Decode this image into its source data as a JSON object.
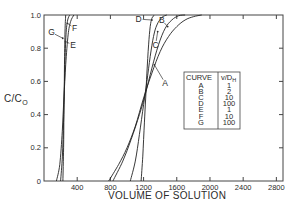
{
  "chart_data": {
    "type": "line",
    "title": "",
    "xlabel": "VOLUME OF SOLUTION",
    "ylabel": "C/C₀",
    "ylabel_main": "C/C",
    "ylabel_sub": "O",
    "xlim": [
      0,
      2880
    ],
    "ylim": [
      0,
      1.0
    ],
    "grid": false,
    "x_ticks": [
      400,
      800,
      1200,
      1600,
      2000,
      2400,
      2800
    ],
    "x_tick_labels": [
      "400",
      "800",
      "1200",
      "1600",
      "2000",
      "2400",
      "2800"
    ],
    "y_ticks": [
      0,
      0.2,
      0.4,
      0.6,
      0.8,
      1.0
    ],
    "y_tick_labels": [
      "0",
      "0.2",
      "0.4",
      "0.6",
      "0.8",
      "1.0"
    ],
    "legend": {
      "position": "inside-lower-right",
      "header": [
        "CURVE",
        "v/Dₕ"
      ],
      "header_curve": "CURVE",
      "header_param_main": "v/D",
      "header_param_sub": "H",
      "rows": [
        {
          "curve": "A",
          "value": "1"
        },
        {
          "curve": "B",
          "value": "2"
        },
        {
          "curve": "C",
          "value": "10"
        },
        {
          "curve": "D",
          "value": "100"
        },
        {
          "curve": "E",
          "value": "1"
        },
        {
          "curve": "F",
          "value": "10"
        },
        {
          "curve": "G",
          "value": "100"
        }
      ]
    },
    "series": [
      {
        "name": "A",
        "vDh": 1,
        "points": [
          [
            780,
            0
          ],
          [
            900,
            0.1
          ],
          [
            1000,
            0.2
          ],
          [
            1100,
            0.33
          ],
          [
            1200,
            0.5
          ],
          [
            1300,
            0.65
          ],
          [
            1400,
            0.78
          ],
          [
            1500,
            0.87
          ],
          [
            1600,
            0.93
          ],
          [
            1700,
            0.97
          ],
          [
            1800,
            0.99
          ],
          [
            1900,
            1.0
          ]
        ]
      },
      {
        "name": "B",
        "vDh": 2,
        "points": [
          [
            830,
            0
          ],
          [
            950,
            0.12
          ],
          [
            1050,
            0.25
          ],
          [
            1150,
            0.4
          ],
          [
            1220,
            0.52
          ],
          [
            1300,
            0.68
          ],
          [
            1380,
            0.82
          ],
          [
            1460,
            0.92
          ],
          [
            1540,
            0.97
          ],
          [
            1620,
            0.995
          ],
          [
            1700,
            1.0
          ]
        ]
      },
      {
        "name": "C",
        "vDh": 10,
        "points": [
          [
            1040,
            0
          ],
          [
            1100,
            0.12
          ],
          [
            1150,
            0.28
          ],
          [
            1200,
            0.46
          ],
          [
            1240,
            0.6
          ],
          [
            1280,
            0.75
          ],
          [
            1320,
            0.87
          ],
          [
            1360,
            0.94
          ],
          [
            1420,
            0.985
          ],
          [
            1480,
            1.0
          ]
        ]
      },
      {
        "name": "D",
        "vDh": 100,
        "points": [
          [
            1170,
            0
          ],
          [
            1190,
            0.15
          ],
          [
            1210,
            0.35
          ],
          [
            1225,
            0.5
          ],
          [
            1240,
            0.65
          ],
          [
            1260,
            0.82
          ],
          [
            1280,
            0.93
          ],
          [
            1300,
            0.98
          ],
          [
            1330,
            1.0
          ]
        ]
      },
      {
        "name": "E",
        "vDh": 1,
        "points": [
          [
            150,
            0
          ],
          [
            190,
            0.1
          ],
          [
            220,
            0.3
          ],
          [
            240,
            0.5
          ],
          [
            262,
            0.7
          ],
          [
            290,
            0.88
          ],
          [
            320,
            0.96
          ],
          [
            360,
            1.0
          ]
        ]
      },
      {
        "name": "F",
        "vDh": 10,
        "points": [
          [
            200,
            0
          ],
          [
            222,
            0.15
          ],
          [
            235,
            0.35
          ],
          [
            243,
            0.5
          ],
          [
            252,
            0.7
          ],
          [
            265,
            0.88
          ],
          [
            285,
            0.97
          ],
          [
            310,
            1.0
          ]
        ]
      },
      {
        "name": "G",
        "vDh": 100,
        "points": [
          [
            228,
            0
          ],
          [
            236,
            0.2
          ],
          [
            240,
            0.4
          ],
          [
            244,
            0.55
          ],
          [
            248,
            0.75
          ],
          [
            254,
            0.92
          ],
          [
            262,
            1.0
          ]
        ]
      }
    ],
    "annotations": [
      {
        "text": "A",
        "at": [
          1330,
          0.7
        ],
        "label_pos": [
          1460,
          0.59
        ]
      },
      {
        "text": "B",
        "at": [
          1490,
          0.93
        ],
        "label_pos": [
          1420,
          0.97
        ]
      },
      {
        "text": "C",
        "at": [
          1370,
          0.9
        ],
        "label_pos": [
          1345,
          0.82
        ]
      },
      {
        "text": "D",
        "at": [
          1300,
          0.97
        ],
        "label_pos": [
          1140,
          0.975
        ]
      },
      {
        "text": "E",
        "at": [
          258,
          0.84
        ],
        "label_pos": [
          350,
          0.82
        ]
      },
      {
        "text": "F",
        "at": [
          282,
          0.95
        ],
        "label_pos": [
          370,
          0.92
        ]
      },
      {
        "text": "G",
        "at": [
          226,
          0.86
        ],
        "label_pos": [
          90,
          0.895
        ]
      }
    ],
    "colors": {
      "line": "#222222",
      "axis": "#444444",
      "background": "#ffffff"
    }
  }
}
